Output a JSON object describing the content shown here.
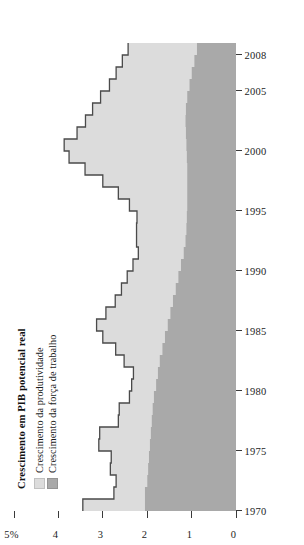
{
  "chart": {
    "title": "Crescimento em PIB potencial real",
    "legend": [
      {
        "label": "Crescimento da produtividade",
        "color": "#dcdcdc",
        "key": "productivity"
      },
      {
        "label": "Crescimento da força de trabalho",
        "color": "#a9a9a9",
        "key": "labor_force"
      }
    ],
    "axis_unit_label": "5%",
    "y_ticks": [
      "0",
      "1",
      "2",
      "3",
      "4",
      "5%"
    ],
    "x_ticks": [
      "1970",
      "1975",
      "1980",
      "1985",
      "1990",
      "1995",
      "2000",
      "2005",
      "2008"
    ]
  },
  "chart_data": {
    "type": "area",
    "title": "Crescimento em PIB potencial real",
    "xlabel": "",
    "ylabel": "",
    "ylim": [
      0,
      5
    ],
    "xlim": [
      1970,
      2008
    ],
    "grid": false,
    "legend_position": "top-left",
    "categories": [
      1970,
      1971,
      1972,
      1973,
      1974,
      1975,
      1976,
      1977,
      1978,
      1979,
      1980,
      1981,
      1982,
      1983,
      1984,
      1985,
      1986,
      1987,
      1988,
      1989,
      1990,
      1991,
      1992,
      1993,
      1994,
      1995,
      1996,
      1997,
      1998,
      1999,
      2000,
      2001,
      2002,
      2003,
      2004,
      2005,
      2006,
      2007,
      2008
    ],
    "series": [
      {
        "name": "Crescimento da força de trabalho",
        "color": "#a9a9a9",
        "values": [
          2.05,
          2.05,
          2.0,
          1.98,
          1.96,
          1.94,
          1.92,
          1.9,
          1.88,
          1.85,
          1.8,
          1.76,
          1.72,
          1.66,
          1.6,
          1.54,
          1.48,
          1.42,
          1.36,
          1.3,
          1.24,
          1.18,
          1.14,
          1.12,
          1.11,
          1.1,
          1.1,
          1.1,
          1.1,
          1.11,
          1.12,
          1.13,
          1.14,
          1.13,
          1.1,
          1.05,
          1.0,
          0.94,
          0.88
        ]
      },
      {
        "name": "Crescimento da produtividade",
        "color": "#dcdcdc",
        "values": [
          1.4,
          0.7,
          0.7,
          0.85,
          0.85,
          1.15,
          1.15,
          0.75,
          0.75,
          0.55,
          0.55,
          0.55,
          0.8,
          1.05,
          1.4,
          1.6,
          1.45,
          1.3,
          1.22,
          1.15,
          1.08,
          1.02,
          1.1,
          1.12,
          1.12,
          1.3,
          1.55,
          1.9,
          2.3,
          2.65,
          2.75,
          2.45,
          2.25,
          2.1,
          1.95,
          1.8,
          1.7,
          1.62,
          1.55
        ]
      }
    ],
    "stacked_totals": [
      3.45,
      2.75,
      2.7,
      2.83,
      2.81,
      3.09,
      3.07,
      2.65,
      2.63,
      2.4,
      2.35,
      2.31,
      2.52,
      2.71,
      3.0,
      3.14,
      2.93,
      2.72,
      2.58,
      2.45,
      2.32,
      2.2,
      2.24,
      2.24,
      2.23,
      2.4,
      2.65,
      3.0,
      3.4,
      3.76,
      3.87,
      3.58,
      3.39,
      3.23,
      3.05,
      2.85,
      2.7,
      2.56,
      2.43
    ]
  }
}
